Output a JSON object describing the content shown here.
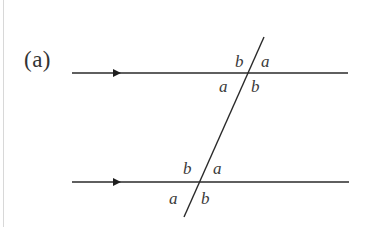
{
  "part_label": "(a)",
  "colors": {
    "line": "#2a2a2a",
    "text": "#333333",
    "border": "#d8d8d8"
  },
  "diagram": {
    "parallel_lines": [
      {
        "name": "top-line",
        "y": 73,
        "x1": 72,
        "x2": 348,
        "arrow_x": 120
      },
      {
        "name": "bottom-line",
        "y": 182,
        "x1": 72,
        "x2": 349,
        "arrow_x": 120
      }
    ],
    "transversal": {
      "x1": 264,
      "y1": 37,
      "x2": 184,
      "y2": 217
    },
    "top_intersection": {
      "upper_left": "b",
      "upper_right": "a",
      "lower_left": "a",
      "lower_right": "b"
    },
    "bottom_intersection": {
      "upper_left": "b",
      "upper_right": "a",
      "lower_left": "a",
      "lower_right": "b"
    }
  }
}
